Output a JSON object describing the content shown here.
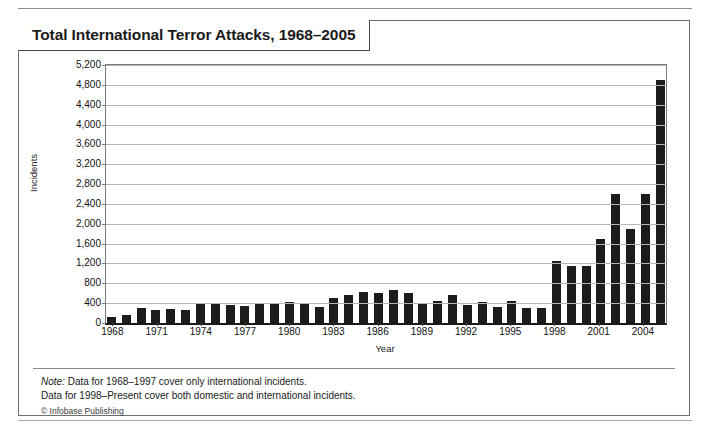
{
  "figure": {
    "title": "Total International Terror Attacks, 1968–2005",
    "notes": [
      {
        "emphasis": "Note:",
        "text": " Data for 1968–1997 cover only international incidents."
      },
      {
        "emphasis": "",
        "text": "Data for 1998–Present cover both domestic and international incidents."
      }
    ],
    "copyright": "© Infobase Publishing",
    "bar_color": "#1c1c1c",
    "grid_color": "#b6b6b6",
    "frame_color": "#6e6e6e"
  },
  "chart_data": {
    "type": "bar",
    "title": "Total International Terror Attacks, 1968–2005",
    "xlabel": "Year",
    "ylabel": "Incidents",
    "ylim": [
      0,
      5200
    ],
    "ytick_step": 400,
    "grid": true,
    "legend": "none",
    "ytick_labels": [
      "5,200",
      "4,800",
      "4,400",
      "4,000",
      "3,600",
      "3,200",
      "2,800",
      "2,400",
      "2,000",
      "1,600",
      "1,200",
      "800",
      "400",
      "0"
    ],
    "ytick_values": [
      5200,
      4800,
      4400,
      4000,
      3600,
      3200,
      2800,
      2400,
      2000,
      1600,
      1200,
      800,
      400,
      0
    ],
    "xtick_labels": [
      "1968",
      "1971",
      "1974",
      "1977",
      "1980",
      "1983",
      "1986",
      "1989",
      "1992",
      "1995",
      "1998",
      "2001",
      "2004"
    ],
    "categories": [
      "1968",
      "1969",
      "1970",
      "1971",
      "1972",
      "1973",
      "1974",
      "1975",
      "1976",
      "1977",
      "1978",
      "1979",
      "1980",
      "1981",
      "1982",
      "1983",
      "1984",
      "1985",
      "1986",
      "1987",
      "1988",
      "1989",
      "1990",
      "1991",
      "1992",
      "1993",
      "1994",
      "1995",
      "1996",
      "1997",
      "1998",
      "1999",
      "2000",
      "2001",
      "2002",
      "2003",
      "2004",
      "2005"
    ],
    "values": [
      125,
      160,
      310,
      270,
      290,
      260,
      390,
      380,
      360,
      350,
      380,
      400,
      420,
      380,
      330,
      500,
      560,
      630,
      610,
      670,
      610,
      380,
      440,
      570,
      360,
      430,
      330,
      440,
      300,
      300,
      1250,
      1150,
      1150,
      1700,
      2600,
      1900,
      2600,
      4900
    ]
  }
}
